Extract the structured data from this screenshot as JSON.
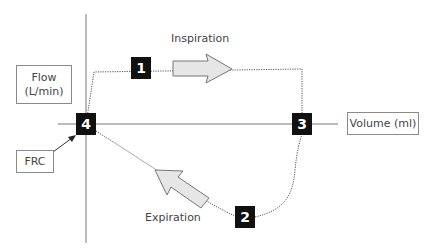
{
  "diagram": {
    "axes": {
      "y_label": "Flow\n(L/min)",
      "y_label_line1": "Flow",
      "y_label_line2": "(L/min)",
      "x_label": "Volume (ml)"
    },
    "annotations": {
      "inspiration": "Inspiration",
      "expiration": "Expiration",
      "frc": "FRC"
    },
    "points": [
      {
        "id": "1",
        "label": "1"
      },
      {
        "id": "2",
        "label": "2"
      },
      {
        "id": "3",
        "label": "3"
      },
      {
        "id": "4",
        "label": "4"
      }
    ],
    "colors": {
      "axis": "#666666",
      "loop": "#555555",
      "arrow_fill": "#e6e6e6",
      "arrow_stroke": "#777777",
      "marker": "#111111"
    }
  }
}
